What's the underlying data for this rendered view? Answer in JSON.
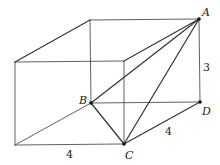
{
  "diagram": {
    "type": "cuboid-with-tetrahedron",
    "stroke_color": "#333333",
    "vertices": {
      "back_top_left": [
        90,
        20
      ],
      "A": [
        199,
        19
      ],
      "front_top_left": [
        15,
        62
      ],
      "front_top_right": [
        124,
        61
      ],
      "B": [
        91,
        103
      ],
      "D": [
        200,
        102
      ],
      "front_bottom_left": [
        15,
        145
      ],
      "C": [
        124,
        144
      ]
    },
    "points": [
      {
        "name": "A",
        "label": "A"
      },
      {
        "name": "B",
        "label": "B"
      },
      {
        "name": "C",
        "label": "C"
      },
      {
        "name": "D",
        "label": "D"
      }
    ],
    "measurements": [
      {
        "edge": "AD",
        "label": "3"
      },
      {
        "edge": "CD",
        "label": "4"
      },
      {
        "edge": "front-bottom",
        "label": "4"
      }
    ],
    "labels": {
      "A": "A",
      "B": "B",
      "C": "C",
      "D": "D",
      "height": "3",
      "depth": "4",
      "width": "4"
    }
  }
}
